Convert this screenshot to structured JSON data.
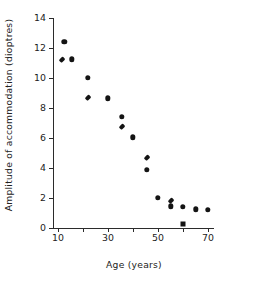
{
  "chart_data": {
    "type": "scatter",
    "title": "",
    "xlabel": "Age (years)",
    "ylabel": "Amplitude of accommodation (dioptres)",
    "xlim": [
      8,
      72
    ],
    "ylim": [
      0,
      14
    ],
    "grid": false,
    "legend": "none",
    "x_major_ticks": [
      10,
      30,
      50,
      70
    ],
    "x_minor_ticks": [
      20,
      40,
      60
    ],
    "x_tick_labels": [
      "10",
      "30",
      "50",
      "70"
    ],
    "y_major_ticks": [
      0,
      2,
      4,
      6,
      8,
      10,
      12,
      14
    ],
    "y_tick_labels": [
      "0",
      "2",
      "4",
      "6",
      "8",
      "10",
      "12",
      "14"
    ],
    "marker_color": "#141414",
    "axis_color": "#2b2b2b",
    "background": "#ffffff",
    "series": [
      {
        "name": "circle-markers",
        "marker": "circle",
        "points": [
          {
            "x": 12.5,
            "y": 12.4
          },
          {
            "x": 15.5,
            "y": 11.25
          },
          {
            "x": 22.0,
            "y": 10.0
          },
          {
            "x": 30.0,
            "y": 8.65
          },
          {
            "x": 35.5,
            "y": 7.4
          },
          {
            "x": 40.0,
            "y": 6.05
          },
          {
            "x": 45.5,
            "y": 3.9
          },
          {
            "x": 50.0,
            "y": 2.0
          },
          {
            "x": 55.0,
            "y": 1.45
          },
          {
            "x": 60.0,
            "y": 1.4
          },
          {
            "x": 65.0,
            "y": 1.25
          },
          {
            "x": 70.0,
            "y": 1.2
          }
        ]
      },
      {
        "name": "diamond-markers",
        "marker": "diamond",
        "points": [
          {
            "x": 11.5,
            "y": 11.2
          },
          {
            "x": 22.0,
            "y": 8.65
          },
          {
            "x": 35.5,
            "y": 6.75
          },
          {
            "x": 45.5,
            "y": 4.7
          },
          {
            "x": 55.0,
            "y": 1.8
          }
        ]
      },
      {
        "name": "square-marker",
        "marker": "square",
        "points": [
          {
            "x": 60.0,
            "y": 0.3
          }
        ]
      }
    ]
  }
}
